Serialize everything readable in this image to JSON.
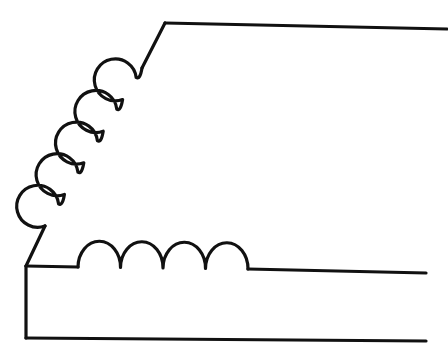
{
  "figure": {
    "kind": "line-diagram",
    "canvas": {
      "width": 448,
      "height": 362,
      "background_color": "#ffffff"
    },
    "style": {
      "stroke_color": "#111111",
      "stroke_width": 3.2,
      "line_cap": "round",
      "line_join": "round",
      "fill": "none"
    },
    "elements": {
      "top_lead": {
        "name": "top-lead-line",
        "points": [
          [
            165,
            23
          ],
          [
            447,
            29
          ]
        ],
        "note": "Upper straight conductor running to the right edge with a slight downward slope to the left corner."
      },
      "top_diagonal": {
        "name": "top-diagonal-segment",
        "points": [
          [
            165,
            23
          ],
          [
            142,
            68
          ]
        ],
        "note": "Short diagonal joining the top lead corner to the first loop of the diagonal coil."
      },
      "diagonal_coil": {
        "name": "diagonal-coil-chain",
        "loop_count": 5,
        "start_point": [
          142,
          68
        ],
        "end_point": [
          45,
          226
        ],
        "loop_radius": 21,
        "direction": "lower-left-to-upper-right",
        "note": "Five circular loops with small cusps stacked along a diagonal."
      },
      "lower_diagonal": {
        "name": "lower-diagonal-segment",
        "points": [
          [
            45,
            226
          ],
          [
            26,
            266
          ]
        ],
        "note": "Short diagonal joining the last diagonal loop to the left corner of the middle conductor."
      },
      "middle_lead_left": {
        "name": "middle-lead-left-line",
        "points": [
          [
            26,
            266
          ],
          [
            78,
            267
          ]
        ],
        "note": "Horizontal stub from the left corner to the first bottom arch."
      },
      "bottom_coil": {
        "name": "bottom-coil-chain",
        "arch_count": 4,
        "start_point": [
          78,
          267
        ],
        "end_point": [
          248,
          269
        ],
        "arch_width": 42,
        "arch_height": 26,
        "note": "Four semicircular arches forming the horizontal coil run."
      },
      "middle_lead_right": {
        "name": "middle-lead-right-line",
        "points": [
          [
            248,
            269
          ],
          [
            426,
            273
          ]
        ],
        "note": "Middle straight conductor running to the right."
      },
      "left_edge": {
        "name": "left-edge-line",
        "points": [
          [
            26,
            266
          ],
          [
            26,
            338
          ]
        ],
        "note": "Vertical line at the left closing the lower band."
      },
      "bottom_lead": {
        "name": "bottom-lead-line",
        "points": [
          [
            26,
            338
          ],
          [
            426,
            341
          ]
        ],
        "note": "Lowest straight conductor running to the right."
      }
    }
  }
}
